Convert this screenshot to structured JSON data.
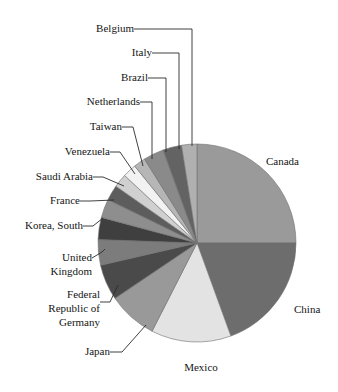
{
  "chart_data": {
    "type": "pie",
    "title": "",
    "subtitle": "",
    "xlabel": "",
    "ylabel": "",
    "legend_position": "none",
    "grid": false,
    "labels_style": "leader-lines-outside",
    "start_angle_deg": 0,
    "direction": "clockwise",
    "categories": [
      "Canada",
      "China",
      "Mexico",
      "Japan",
      "Federal Republic of Germany",
      "United Kingdom",
      "Korea, South",
      "France",
      "Saudi Arabia",
      "Venezuela",
      "Taiwan",
      "Netherlands",
      "Brazil",
      "Italy",
      "Belgium"
    ],
    "values": [
      25.0,
      19.5,
      13.0,
      8.0,
      5.8,
      4.3,
      3.6,
      3.1,
      2.6,
      2.3,
      2.1,
      1.9,
      1.6,
      1.4,
      1.1
    ],
    "slices": [
      {
        "label": "Canada",
        "value": 25.0,
        "start_deg": 0,
        "end_deg": 90,
        "color": "#9a9a9a"
      },
      {
        "label": "China",
        "value": 19.5,
        "start_deg": 90,
        "end_deg": 160,
        "color": "#6d6d6d"
      },
      {
        "label": "Mexico",
        "value": 13.0,
        "start_deg": 160,
        "end_deg": 207,
        "color": "#e3e3e3"
      },
      {
        "label": "Japan",
        "value": 8.0,
        "start_deg": 207,
        "end_deg": 236,
        "color": "#999999"
      },
      {
        "label": "Federal Republic of Germany",
        "value": 5.8,
        "start_deg": 236,
        "end_deg": 257,
        "color": "#4a4a4a"
      },
      {
        "label": "United Kingdom",
        "value": 4.3,
        "start_deg": 257,
        "end_deg": 272,
        "color": "#7c7c7c"
      },
      {
        "label": "Korea, South",
        "value": 3.6,
        "start_deg": 272,
        "end_deg": 285,
        "color": "#3f3f3f"
      },
      {
        "label": "France",
        "value": 3.1,
        "start_deg": 285,
        "end_deg": 296,
        "color": "#8e8e8e"
      },
      {
        "label": "Saudi Arabia",
        "value": 2.6,
        "start_deg": 296,
        "end_deg": 305,
        "color": "#5d5d5d"
      },
      {
        "label": "Venezuela",
        "value": 2.3,
        "start_deg": 305,
        "end_deg": 313,
        "color": "#d0d0d0"
      },
      {
        "label": "Taiwan",
        "value": 2.1,
        "start_deg": 313,
        "end_deg": 321,
        "color": "#f2f2f2"
      },
      {
        "label": "Netherlands",
        "value": 1.9,
        "start_deg": 321,
        "end_deg": 328,
        "color": "#b6b6b6"
      },
      {
        "label": "Brazil",
        "value": 1.6,
        "start_deg": 328,
        "end_deg": 340,
        "color": "#8a8a8a"
      },
      {
        "label": "Italy",
        "value": 1.4,
        "start_deg": 340,
        "end_deg": 351,
        "color": "#636363"
      },
      {
        "label": "Belgium",
        "value": 1.1,
        "start_deg": 351,
        "end_deg": 360,
        "color": "#b0b0b0"
      }
    ]
  },
  "labels": {
    "belgium": "Belgium",
    "italy": "Italy",
    "brazil": "Brazil",
    "netherlands": "Netherlands",
    "taiwan": "Taiwan",
    "venezuela": "Venezuela",
    "saudi_arabia": "Saudi Arabia",
    "france": "France",
    "korea_south": "Korea, South",
    "united_kingdom_line1": "United",
    "united_kingdom_line2": "Kingdom",
    "germany_line1": "Federal",
    "germany_line2": "Republic of",
    "germany_line3": "Germany",
    "japan": "Japan",
    "mexico": "Mexico",
    "china": "China",
    "canada": "Canada"
  },
  "colors": {
    "background": "#ffffff",
    "text": "#151515",
    "leader_line": "#2b2b2b",
    "slice_outline": "#6e6e6e"
  }
}
